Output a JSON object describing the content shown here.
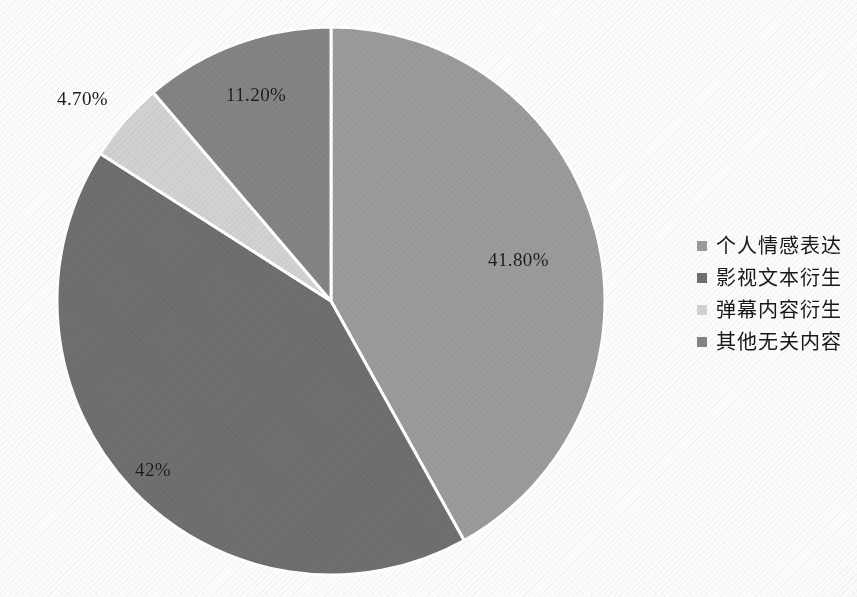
{
  "chart_data": {
    "type": "pie",
    "title": "",
    "subtitle": "",
    "categories": [
      "个人情感表达",
      "影视文本衍生",
      "弹幕内容衍生",
      "其他无关内容"
    ],
    "values": [
      41.8,
      42,
      4.7,
      11.2
    ],
    "value_labels": [
      "41.80%",
      "42%",
      "4.70%",
      "11.20%"
    ],
    "colors": [
      "#9b9b9b",
      "#6f6f6f",
      "#d2d2d2",
      "#848484"
    ],
    "units": "percent",
    "start_angle_deg": 0,
    "direction": "clockwise",
    "legend_position": "right",
    "grid": false,
    "xlabel": "",
    "ylabel": "",
    "slice_separator_color": "#ffffff"
  },
  "pie_geometry": {
    "center_x": 331,
    "center_y": 301,
    "radius": 274
  },
  "slice_label_positions": [
    {
      "text": "41.80%",
      "x": 488,
      "y": 249
    },
    {
      "text": "42%",
      "x": 135,
      "y": 459
    },
    {
      "text": "4.70%",
      "x": 57,
      "y": 88
    },
    {
      "text": "11.20%",
      "x": 226,
      "y": 84
    }
  ],
  "legend": {
    "items": [
      {
        "label": "个人情感表达",
        "color": "#9b9b9b"
      },
      {
        "label": "影视文本衍生",
        "color": "#6f6f6f"
      },
      {
        "label": "弹幕内容衍生",
        "color": "#d2d2d2"
      },
      {
        "label": "其他无关内容",
        "color": "#848484"
      }
    ]
  },
  "background": {
    "page_color": "#fcfcfb"
  }
}
